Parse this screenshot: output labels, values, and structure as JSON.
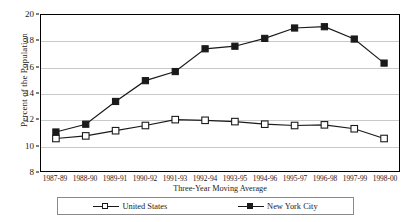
{
  "chart_data": {
    "type": "line",
    "title": "",
    "xlabel": "Three-Year Moving Average",
    "ylabel": "Percent of the Population",
    "ylim": [
      8,
      20
    ],
    "yticks": [
      8,
      10,
      12,
      14,
      16,
      18,
      20
    ],
    "grid": true,
    "legend_position": "bottom",
    "categories": [
      "1987-89",
      "1988-90",
      "1989-91",
      "1990-92",
      "1991-93",
      "1992-94",
      "1993-95",
      "1994-96",
      "1995-97",
      "1996-98",
      "1997-99",
      "1998-00"
    ],
    "series": [
      {
        "name": "United States",
        "marker": "open-square",
        "color": "#1a1a1a",
        "values": [
          10.5,
          10.7,
          11.1,
          11.5,
          11.95,
          11.9,
          11.8,
          11.6,
          11.5,
          11.55,
          11.25,
          10.5
        ]
      },
      {
        "name": "New York City",
        "marker": "filled-square",
        "color": "#1a1a1a",
        "values": [
          11.0,
          11.6,
          13.35,
          14.95,
          15.65,
          17.4,
          17.6,
          18.2,
          19.0,
          19.1,
          18.15,
          16.3
        ]
      }
    ]
  },
  "legend": {
    "entries": [
      {
        "label": "United States"
      },
      {
        "label": "New York City"
      }
    ]
  }
}
